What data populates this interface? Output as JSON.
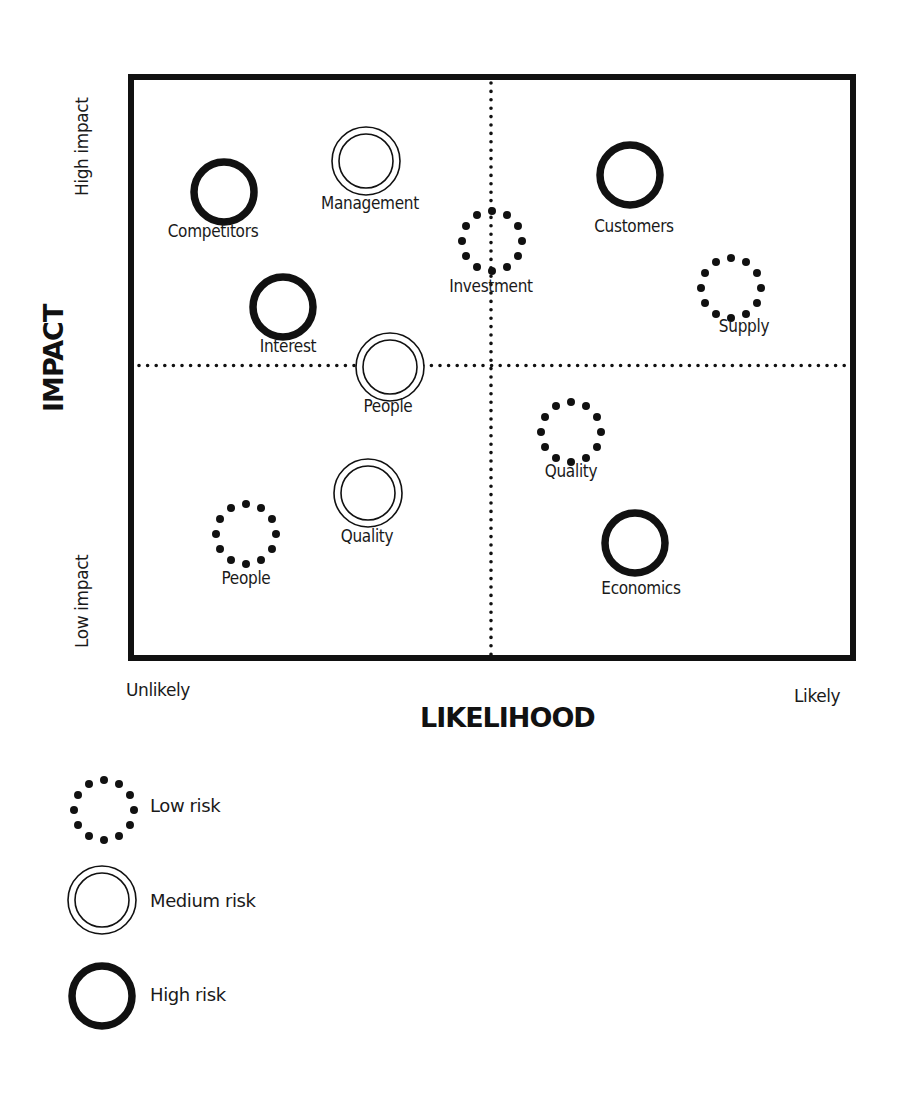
{
  "chart_data": {
    "type": "scatter",
    "xlabel": "LIKELIHOOD",
    "ylabel": "IMPACT",
    "x_axis_ends": {
      "min_label": "Unlikely",
      "max_label": "Likely"
    },
    "y_axis_ends": {
      "min_label": "Low impact",
      "max_label": "High impact"
    },
    "xlim": [
      0,
      100
    ],
    "ylim": [
      0,
      100
    ],
    "quadrant_dividers": {
      "x": 50,
      "y": 50,
      "style": "dotted"
    },
    "legend": [
      {
        "key": "low",
        "label": "Low risk",
        "style": "dotted-ring"
      },
      {
        "key": "medium",
        "label": "Medium risk",
        "style": "double-ring"
      },
      {
        "key": "high",
        "label": "High risk",
        "style": "thick-ring"
      }
    ],
    "points": [
      {
        "label": "Competitors",
        "risk": "high",
        "x": 13,
        "y": 81
      },
      {
        "label": "Management",
        "risk": "medium",
        "x": 32,
        "y": 86
      },
      {
        "label": "Investment",
        "risk": "low",
        "x": 50,
        "y": 72
      },
      {
        "label": "Customers",
        "risk": "high",
        "x": 69,
        "y": 83
      },
      {
        "label": "Supply",
        "risk": "low",
        "x": 85,
        "y": 62
      },
      {
        "label": "Interest",
        "risk": "high",
        "x": 21,
        "y": 61
      },
      {
        "label": "People",
        "risk": "medium",
        "x": 36,
        "y": 50
      },
      {
        "label": "Quality",
        "risk": "low",
        "x": 61,
        "y": 39
      },
      {
        "label": "Quality",
        "risk": "medium",
        "x": 33,
        "y": 28
      },
      {
        "label": "People",
        "risk": "low",
        "x": 16,
        "y": 20
      },
      {
        "label": "Economics",
        "risk": "high",
        "x": 70,
        "y": 20
      }
    ]
  },
  "colors": {
    "ink": "#111111",
    "background": "#ffffff"
  },
  "plot": {
    "frame_px": {
      "left": 131,
      "top": 77,
      "right": 853,
      "bottom": 658
    },
    "points_px": [
      {
        "cx": 224,
        "cy": 192,
        "label_x": 213,
        "label_y": 233
      },
      {
        "cx": 366,
        "cy": 161,
        "label_x": 370,
        "label_y": 205
      },
      {
        "cx": 492,
        "cy": 241,
        "label_x": 491,
        "label_y": 288
      },
      {
        "cx": 630,
        "cy": 175,
        "label_x": 634,
        "label_y": 228
      },
      {
        "cx": 731,
        "cy": 288,
        "label_x": 744,
        "label_y": 328
      },
      {
        "cx": 283,
        "cy": 307,
        "label_x": 288,
        "label_y": 348
      },
      {
        "cx": 390,
        "cy": 367,
        "label_x": 388,
        "label_y": 408
      },
      {
        "cx": 571,
        "cy": 432,
        "label_x": 571,
        "label_y": 473
      },
      {
        "cx": 368,
        "cy": 493,
        "label_x": 367,
        "label_y": 538
      },
      {
        "cx": 246,
        "cy": 534,
        "label_x": 246,
        "label_y": 580
      },
      {
        "cx": 635,
        "cy": 543,
        "label_x": 641,
        "label_y": 590
      }
    ]
  }
}
